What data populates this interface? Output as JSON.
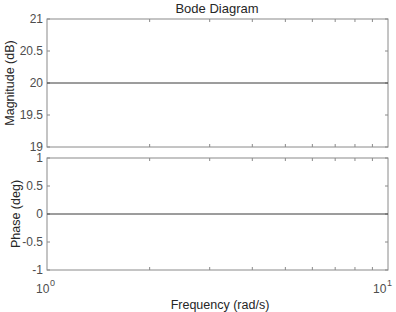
{
  "chart_data": [
    {
      "type": "line",
      "panel": "magnitude",
      "title": "Bode Diagram",
      "xlabel": "Frequency  (rad/s)",
      "ylabel": "Magnitude (dB)",
      "xscale": "log",
      "xlim": [
        1,
        10
      ],
      "ylim": [
        19,
        21
      ],
      "yticks": [
        "21",
        "20.5",
        "20",
        "19.5",
        "19"
      ],
      "grid": false,
      "series": [
        {
          "name": "magnitude",
          "x": [
            1,
            10
          ],
          "values": [
            20,
            20
          ]
        }
      ]
    },
    {
      "type": "line",
      "panel": "phase",
      "xlabel": "Frequency  (rad/s)",
      "ylabel": "Phase (deg)",
      "xscale": "log",
      "xlim": [
        1,
        10
      ],
      "ylim": [
        -1,
        1
      ],
      "yticks": [
        "1",
        "0.5",
        "0",
        "-0.5",
        "-1"
      ],
      "xticks": [
        "10^0",
        "10^1"
      ],
      "grid": false,
      "series": [
        {
          "name": "phase",
          "x": [
            1,
            10
          ],
          "values": [
            0,
            0
          ]
        }
      ]
    }
  ],
  "labels": {
    "title": "Bode Diagram",
    "xlabel": "Frequency  (rad/s)",
    "mag_ylabel": "Magnitude (dB)",
    "phase_ylabel": "Phase (deg)",
    "mag_ticks": [
      "21",
      "20.5",
      "20",
      "19.5",
      "19"
    ],
    "phase_ticks": [
      "1",
      "0.5",
      "0",
      "-0.5",
      "-1"
    ],
    "x_base": "10",
    "x_exp0": "0",
    "x_exp1": "1"
  },
  "colors": {
    "axis": "#262626",
    "line": "#3a3a3a",
    "tick_label": "#4d4d4d"
  }
}
